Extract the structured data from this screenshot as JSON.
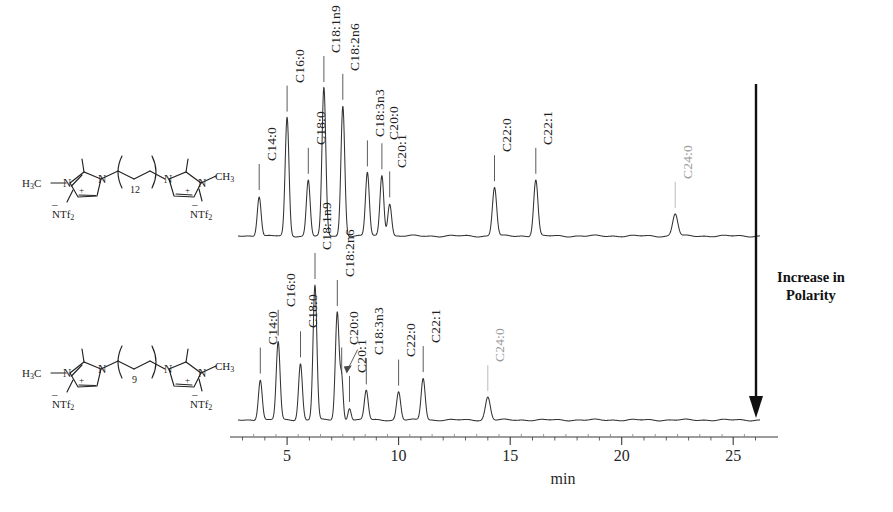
{
  "figure": {
    "annotation": {
      "polarity_label": "Increase in\nPolarity",
      "arrow_name": "downward-arrow"
    },
    "axis": {
      "unit_label": "min",
      "tick_labels": [
        "5",
        "10",
        "15",
        "20",
        "25"
      ],
      "tick_values": [
        5,
        10,
        15,
        20,
        25
      ],
      "xmin": 2.8,
      "xmax": 26.2,
      "minor_tick_step": 1
    },
    "structures": [
      {
        "name": "structure-c12-linker",
        "bridge_subscript": "12",
        "left_group": "H3C",
        "right_group": "CH3",
        "anion_left": "NTf2",
        "anion_right": "NTf2",
        "charge": "+",
        "anion_charge": "-"
      },
      {
        "name": "structure-c9-linker",
        "bridge_subscript": "9",
        "left_group": "H3C",
        "right_group": "CH3",
        "anion_left": "NTf2",
        "anion_right": "NTf2",
        "charge": "+",
        "anion_charge": "-"
      }
    ]
  },
  "chart_data": {
    "type": "line",
    "xlabel": "min",
    "ylabel": "",
    "xlim": [
      2.8,
      26.2
    ],
    "grid": false,
    "legend": "none",
    "series": [
      {
        "name": "top-chromatogram-C12",
        "structure": "structure-c12-linker",
        "peaks": [
          {
            "label": "C14:0",
            "rt": 3.75,
            "height": 0.27,
            "width": 0.085,
            "faint": false
          },
          {
            "label": "C16:0",
            "rt": 5.0,
            "height": 0.8,
            "width": 0.085,
            "faint": false
          },
          {
            "label": "C18:0",
            "rt": 5.95,
            "height": 0.38,
            "width": 0.085,
            "faint": false
          },
          {
            "label": "C18:1n9",
            "rt": 6.65,
            "height": 1.0,
            "width": 0.085,
            "faint": false
          },
          {
            "label": "C18:2n6",
            "rt": 7.5,
            "height": 0.88,
            "width": 0.085,
            "faint": false
          },
          {
            "label": "C18:3n3",
            "rt": 8.6,
            "height": 0.43,
            "width": 0.085,
            "faint": false
          },
          {
            "label": "C20:0",
            "rt": 9.25,
            "height": 0.41,
            "width": 0.085,
            "faint": false
          },
          {
            "label": "C20:1",
            "rt": 9.6,
            "height": 0.22,
            "width": 0.085,
            "faint": false
          },
          {
            "label": "C22:0",
            "rt": 14.3,
            "height": 0.33,
            "width": 0.095,
            "faint": false
          },
          {
            "label": "C22:1",
            "rt": 16.15,
            "height": 0.38,
            "width": 0.095,
            "faint": false
          },
          {
            "label": "C24:0",
            "rt": 22.4,
            "height": 0.15,
            "width": 0.115,
            "faint": true
          }
        ]
      },
      {
        "name": "bottom-chromatogram-C9",
        "structure": "structure-c9-linker",
        "peaks": [
          {
            "label": "C14:0",
            "rt": 3.8,
            "height": 0.3,
            "width": 0.085,
            "faint": false
          },
          {
            "label": "C16:0",
            "rt": 4.6,
            "height": 0.58,
            "width": 0.085,
            "faint": false
          },
          {
            "label": "C18:0",
            "rt": 5.6,
            "height": 0.42,
            "width": 0.085,
            "faint": false
          },
          {
            "label": "C18:1n9",
            "rt": 6.25,
            "height": 1.0,
            "width": 0.085,
            "faint": false
          },
          {
            "label": "C18:2n6",
            "rt": 7.25,
            "height": 0.8,
            "width": 0.085,
            "faint": false
          },
          {
            "label": "C20:0",
            "rt": 7.45,
            "height": 0.3,
            "width": 0.065,
            "faint": false
          },
          {
            "label": "C20:1",
            "rt": 7.8,
            "height": 0.09,
            "width": 0.07,
            "faint": false
          },
          {
            "label": "C18:3n3",
            "rt": 8.55,
            "height": 0.22,
            "width": 0.085,
            "faint": false
          },
          {
            "label": "C22:0",
            "rt": 10.0,
            "height": 0.21,
            "width": 0.09,
            "faint": false
          },
          {
            "label": "C22:1",
            "rt": 11.1,
            "height": 0.31,
            "width": 0.09,
            "faint": false
          },
          {
            "label": "C24:0",
            "rt": 14.0,
            "height": 0.17,
            "width": 0.11,
            "faint": true
          }
        ]
      }
    ]
  }
}
